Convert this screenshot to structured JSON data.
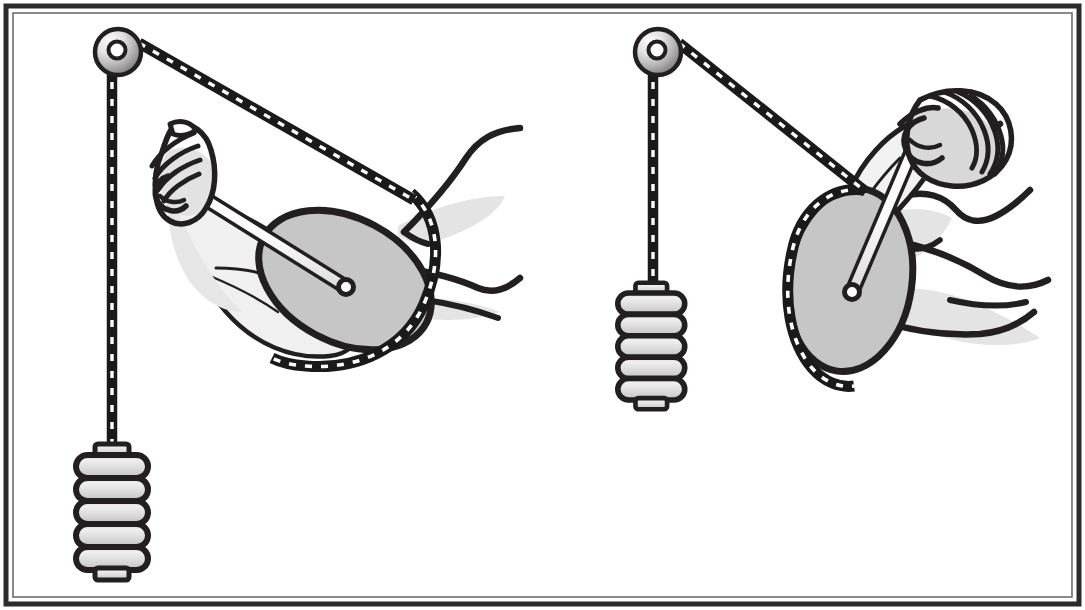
{
  "figure": {
    "title": "Elbow joint modeled as a cable-and-cam pulley system",
    "caption": "",
    "width": 1085,
    "height": 610,
    "background_color": "#ffffff",
    "border": {
      "outer_color": "#2b2b2b",
      "inner_color": "#5a5a5a",
      "thickness_px": 6
    }
  },
  "palette": {
    "ink": "#231f20",
    "ink_light": "#3a3a3a",
    "cam_fill": "#c6c6c6",
    "cam_stroke": "#231f20",
    "weight_plate_light": "#e3e3e3",
    "weight_plate_mid": "#cfcfcf",
    "weight_stroke": "#231f20",
    "pulley_light": "#f2f2f2",
    "pulley_dark": "#8e8e8e",
    "skin_shade": "#e0e0e0",
    "skin_fill": "#f2f2f2",
    "cable_core": "#1a1a1a",
    "cable_dash": "#ffffff",
    "rod_fill": "#ffffff",
    "rod_stroke": "#231f20"
  },
  "panels": [
    {
      "id": "panel-left",
      "name": "extended-arm-panel",
      "label": "Arm extended — cam rotated, long moment arm",
      "pulley": {
        "cx": 118,
        "cy": 52,
        "r_outer": 23,
        "r_hub": 8.5
      },
      "cam": {
        "cx": 345,
        "cy": 280,
        "rx": 92,
        "ry": 62,
        "rotation_deg": 28,
        "pivot_r": 7
      },
      "weight_stack": {
        "x": 70,
        "y": 450,
        "width": 78,
        "height": 120,
        "plates": 5,
        "has_top_cap": true,
        "has_base": true
      },
      "cable": {
        "vertical_x": 112,
        "top_y": 52,
        "bottom_y": 452,
        "span_from": [
          140,
          45
        ],
        "span_to": [
          420,
          250
        ]
      },
      "forearm_rod": {
        "from": [
          178,
          182
        ],
        "to": [
          346,
          287
        ]
      }
    },
    {
      "id": "panel-right",
      "name": "flexed-arm-panel",
      "label": "Arm flexed — cam rotated, short moment arm",
      "pulley": {
        "cx": 658,
        "cy": 52,
        "r_outer": 23,
        "r_hub": 8.5
      },
      "cam": {
        "cx": 850,
        "cy": 280,
        "rx": 62,
        "ry": 92,
        "rotation_deg": 8,
        "pivot_r": 7
      },
      "weight_stack": {
        "x": 592,
        "y": 288,
        "width": 70,
        "height": 112,
        "plates": 5,
        "has_top_cap": true,
        "has_base": true
      },
      "cable": {
        "vertical_x": 652,
        "top_y": 52,
        "bottom_y": 290,
        "span_from": [
          680,
          45
        ],
        "span_to": [
          865,
          186
        ]
      },
      "forearm_rod": {
        "from": [
          925,
          120
        ],
        "to": [
          851,
          292
        ]
      }
    }
  ],
  "elements": {
    "pulley_label": "overhead-pulley",
    "cam_label": "elbow-cam",
    "cable_label": "braided-cable",
    "weight_label": "weight-stack",
    "hand_label": "clenched-fist",
    "arm_label": "arm-outline",
    "rod_label": "forearm-rod"
  }
}
